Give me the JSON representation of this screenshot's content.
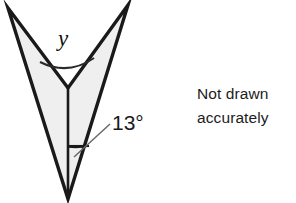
{
  "figure": {
    "type": "geometry-diagram",
    "shape_name": "dart-quadrilateral",
    "fill_color": "#efefef",
    "stroke_color": "#1a1a1a",
    "leader_color": "#555555",
    "arc_color": "#2a2a2a",
    "background_color": "#ffffff",
    "vertices": {
      "left_tip": [
        8,
        8
      ],
      "right_tip": [
        128,
        5
      ],
      "notch": [
        68,
        88
      ],
      "bottom_tip": [
        68,
        199
      ]
    },
    "axis_line": {
      "x": 68,
      "y_top": 88,
      "y_bottom": 199
    }
  },
  "labels": {
    "angle_y": {
      "text": "y",
      "kind": "unknown-angle",
      "at_vertex": "notch",
      "x": 63,
      "y": 46
    },
    "angle_13": {
      "text": "13°",
      "value": 13,
      "unit": "degrees",
      "at_vertex": "bottom_tip",
      "x": 112,
      "y": 130
    }
  },
  "note": {
    "line1": "Not drawn",
    "line2": "accurately"
  }
}
